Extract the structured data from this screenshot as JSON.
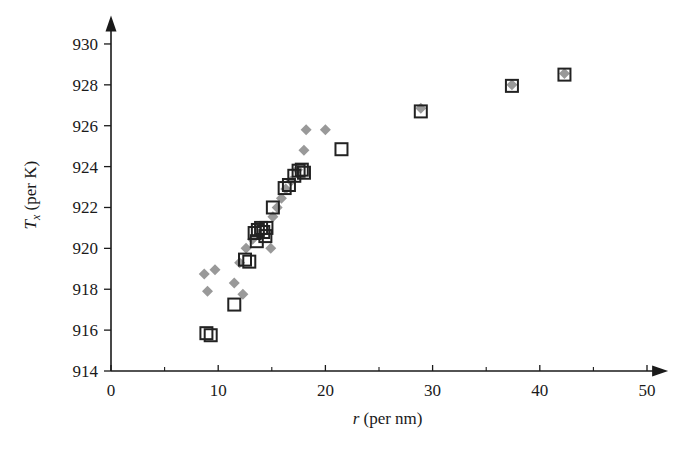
{
  "chart_data": {
    "type": "scatter",
    "title": "",
    "xlabel": "r (per nm)",
    "ylabel": "T_x (per K)",
    "xlabel_italic_part": "r",
    "xlabel_rest": " (per nm)",
    "ylabel_italic_part": "T",
    "ylabel_sub": "x",
    "ylabel_rest": " (per K)",
    "xlim": [
      0,
      52
    ],
    "ylim": [
      914,
      931
    ],
    "xticks": [
      0,
      10,
      20,
      30,
      40,
      50
    ],
    "xticklabels": [
      "0",
      "10",
      "20",
      "30",
      "40",
      "50"
    ],
    "xticks_minor": [
      5,
      15,
      25,
      35,
      45
    ],
    "yticks": [
      914,
      916,
      918,
      920,
      922,
      924,
      926,
      928,
      930
    ],
    "yticklabels": [
      "914",
      "916",
      "918",
      "920",
      "922",
      "924",
      "926",
      "928",
      "930"
    ],
    "grid": false,
    "legend": "none",
    "axis_style": "arrow-tipped L-shaped axes",
    "series": [
      {
        "name": "open squares",
        "marker": "square",
        "marker_fill": "none",
        "marker_edge_color": "#222222",
        "marker_size_px": 12,
        "points": [
          [
            8.9,
            915.85
          ],
          [
            9.3,
            915.75
          ],
          [
            11.5,
            917.25
          ],
          [
            12.5,
            919.45
          ],
          [
            12.9,
            919.35
          ],
          [
            13.6,
            920.35
          ],
          [
            13.4,
            920.75
          ],
          [
            13.7,
            920.9
          ],
          [
            14.0,
            921.0
          ],
          [
            14.2,
            920.8
          ],
          [
            14.5,
            921.0
          ],
          [
            14.4,
            920.6
          ],
          [
            15.1,
            922.0
          ],
          [
            16.2,
            922.95
          ],
          [
            16.6,
            923.1
          ],
          [
            17.1,
            923.55
          ],
          [
            17.5,
            923.8
          ],
          [
            17.8,
            923.85
          ],
          [
            18.0,
            923.7
          ],
          [
            21.5,
            924.85
          ],
          [
            28.9,
            926.7
          ],
          [
            37.4,
            927.95
          ],
          [
            42.3,
            928.5
          ]
        ]
      },
      {
        "name": "gray diamonds",
        "marker": "diamond",
        "marker_fill": "#999999",
        "marker_edge_color": "none",
        "marker_size_px": 11,
        "points": [
          [
            8.7,
            918.75
          ],
          [
            9.7,
            918.95
          ],
          [
            9.0,
            917.9
          ],
          [
            11.5,
            918.3
          ],
          [
            12.3,
            917.75
          ],
          [
            12.0,
            919.3
          ],
          [
            12.6,
            920.0
          ],
          [
            13.2,
            920.45
          ],
          [
            14.9,
            920.0
          ],
          [
            15.1,
            921.55
          ],
          [
            15.5,
            922.0
          ],
          [
            15.9,
            922.45
          ],
          [
            16.3,
            922.9
          ],
          [
            16.8,
            923.3
          ],
          [
            17.4,
            923.85
          ],
          [
            18.0,
            924.8
          ],
          [
            18.2,
            925.8
          ],
          [
            20.0,
            925.8
          ],
          [
            28.9,
            926.85
          ],
          [
            37.4,
            928.0
          ],
          [
            42.3,
            928.55
          ]
        ]
      }
    ]
  },
  "colors": {
    "axis": "#1a1a1a",
    "square_edge": "#222222",
    "diamond_fill": "#999999",
    "background": "#ffffff"
  }
}
